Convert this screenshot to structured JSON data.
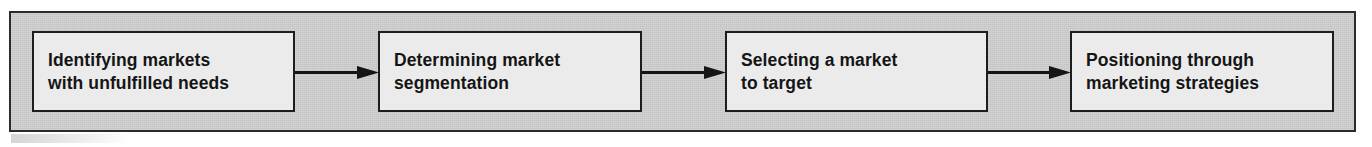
{
  "figure": {
    "type": "process-flow",
    "orientation": "horizontal",
    "step_count": 4,
    "connector_count": 3,
    "connector_style": "solid-line-with-filled-arrowhead",
    "colors": {
      "panel_background": "#c9c9c9",
      "panel_border": "#2b2b2b",
      "box_background": "#ebebeb",
      "box_border": "#1d1d1d",
      "text": "#151515",
      "arrow": "#151515",
      "page_background": "#ffffff"
    }
  },
  "steps": [
    {
      "index": 1,
      "label": "Identifying markets\nwith unfulfilled needs",
      "line1": "Identifying markets",
      "line2": "with unfulfilled needs"
    },
    {
      "index": 2,
      "label": "Determining market\nsegmentation",
      "line1": "Determining market",
      "line2": "segmentation"
    },
    {
      "index": 3,
      "label": "Selecting a market\nto target",
      "line1": "Selecting a market",
      "line2": "to target"
    },
    {
      "index": 4,
      "label": "Positioning through\nmarketing strategies",
      "line1": "Positioning through",
      "line2": "marketing strategies"
    }
  ],
  "connectors": [
    {
      "index": 1,
      "from_step": 1,
      "to_step": 2,
      "direction": "right"
    },
    {
      "index": 2,
      "from_step": 2,
      "to_step": 3,
      "direction": "right"
    },
    {
      "index": 3,
      "from_step": 3,
      "to_step": 4,
      "direction": "right"
    }
  ]
}
